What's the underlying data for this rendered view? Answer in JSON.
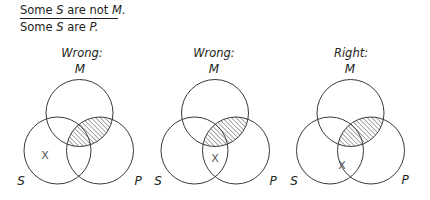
{
  "premises": {
    "line1": {
      "pre": "Some ",
      "s": "S",
      "mid": " are not ",
      "m": "M."
    },
    "line2": {
      "pre": "Some ",
      "s": "S",
      "mid": " are ",
      "p": "P."
    }
  },
  "diagrams": [
    {
      "title": "Wrong:",
      "labels": {
        "m": "M",
        "s": "S",
        "p": "P"
      },
      "x_mark": "X",
      "x_position": "S only (outside M and P)"
    },
    {
      "title": "Wrong:",
      "labels": {
        "m": "M",
        "s": "S",
        "p": "P"
      },
      "x_mark": "X",
      "x_position": "S ∩ P, outside M"
    },
    {
      "title": "Right:",
      "labels": {
        "m": "M",
        "s": "S",
        "p": "P"
      },
      "x_mark": "X",
      "x_position": "on line of P within S, outside M"
    }
  ],
  "shading": {
    "region": "M ∩ P",
    "style": "diagonal hatch"
  },
  "colors": {
    "stroke": "#3a3a3a",
    "text": "#231f20",
    "hatch": "#555555"
  }
}
